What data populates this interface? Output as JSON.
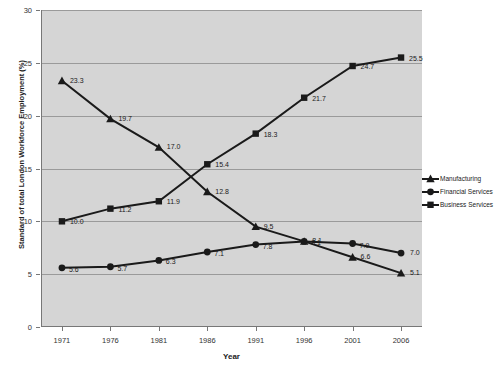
{
  "chart_data": {
    "type": "line",
    "title": "",
    "xlabel": "Year",
    "ylabel": "Standard of total London Workforce Employment (%)",
    "categories": [
      "1971",
      "1976",
      "1981",
      "1986",
      "1991",
      "1996",
      "2001",
      "2006"
    ],
    "x": [
      1971,
      1976,
      1981,
      1986,
      1991,
      1996,
      2001,
      2006
    ],
    "ylim": [
      0,
      30
    ],
    "yticks": [
      "0",
      "5",
      "10",
      "15",
      "20",
      "25",
      "30"
    ],
    "grid": true,
    "legend_position": "right",
    "series": [
      {
        "name": "Manufacturing",
        "marker": "triangle",
        "color": "#1a1a1a",
        "values": [
          23.3,
          19.7,
          17.0,
          12.8,
          9.5,
          8.1,
          6.6,
          5.1
        ],
        "labels": [
          "23.3",
          "19.7",
          "17.0",
          "12.8",
          "9.5",
          "8.1",
          "6.6",
          "5.1"
        ]
      },
      {
        "name": "Financial Services",
        "marker": "circle",
        "color": "#1a1a1a",
        "values": [
          5.6,
          5.7,
          6.3,
          7.1,
          7.8,
          8.1,
          7.9,
          7.0
        ],
        "labels": [
          "5.6",
          "5.7",
          "6.3",
          "7.1",
          "7.8",
          "8.1",
          "7.9",
          "7.0"
        ]
      },
      {
        "name": "Business Services",
        "marker": "square",
        "color": "#1a1a1a",
        "values": [
          10.0,
          11.2,
          11.9,
          15.4,
          18.3,
          21.7,
          24.7,
          25.5
        ],
        "labels": [
          "10.0",
          "11.2",
          "11.9",
          "15.4",
          "18.3",
          "21.7",
          "24.7",
          "25.5"
        ]
      }
    ]
  },
  "legend": {
    "items": [
      {
        "label": "Manufacturing"
      },
      {
        "label": "Financial Services"
      },
      {
        "label": "Business Services"
      }
    ]
  },
  "axes": {
    "x_title": "Year",
    "y_title": "Standard of total London Workforce Employment (%)"
  }
}
